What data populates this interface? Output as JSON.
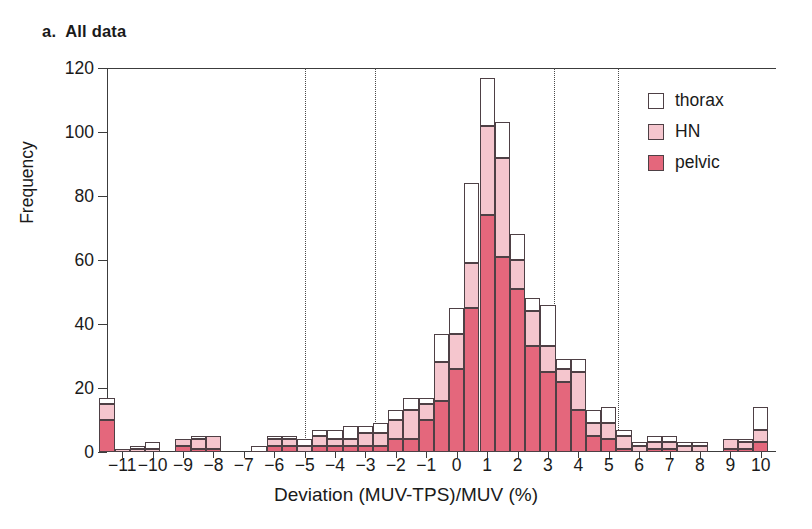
{
  "panel": {
    "label": "a.",
    "title": "All data"
  },
  "legend": {
    "position": "top-right",
    "entries": [
      {
        "name": "thorax",
        "color": "#ffffff"
      },
      {
        "name": "HN",
        "color": "#f5c6ce"
      },
      {
        "name": "pelvic",
        "color": "#e4677c"
      }
    ]
  },
  "chart_data": {
    "type": "bar",
    "subtype": "stacked-histogram",
    "title": "All data",
    "xlabel": "Deviation (MUV-TPS)/MUV (%)",
    "ylabel": "Frequency",
    "xlim": [
      -11.5,
      10.5
    ],
    "ylim": [
      0,
      120
    ],
    "yticks": [
      0,
      20,
      40,
      60,
      80,
      100,
      120
    ],
    "xticks": [
      -11,
      -10,
      -9,
      -8,
      -7,
      -6,
      -5,
      -4,
      -3,
      -2,
      -1,
      0,
      1,
      2,
      3,
      4,
      5,
      6,
      7,
      8,
      9,
      10
    ],
    "grid": "vertical-dotted",
    "gridlines_x": [
      -5.0,
      -2.7,
      3.2,
      5.3
    ],
    "bin_width": 0.5,
    "categories": [
      "-11.5",
      "-11.0",
      "-10.5",
      "-10.0",
      "-9.5",
      "-9.0",
      "-8.5",
      "-8.0",
      "-7.5",
      "-7.0",
      "-6.5",
      "-6.0",
      "-5.5",
      "-5.0",
      "-4.5",
      "-4.0",
      "-3.5",
      "-3.0",
      "-2.5",
      "-2.0",
      "-1.5",
      "-1.0",
      "-0.5",
      "0.0",
      "0.5",
      "1.0",
      "1.5",
      "2.0",
      "2.5",
      "3.0",
      "3.5",
      "4.0",
      "4.5",
      "5.0",
      "5.5",
      "6.0",
      "6.5",
      "7.0",
      "7.5",
      "8.0",
      "8.5",
      "9.0",
      "9.5",
      "10.0"
    ],
    "series": [
      {
        "name": "pelvic",
        "color": "#e4677c",
        "values": [
          10,
          0,
          0,
          0,
          0,
          2,
          1,
          1,
          0,
          0,
          0,
          2,
          2,
          0,
          2,
          2,
          2,
          2,
          2,
          4,
          4,
          10,
          16,
          26,
          45,
          74,
          61,
          51,
          33,
          25,
          22,
          13,
          5,
          4,
          1,
          0,
          1,
          1,
          0,
          0,
          0,
          1,
          1,
          3
        ]
      },
      {
        "name": "HN",
        "color": "#f5c6ce",
        "values": [
          5,
          1,
          1,
          1,
          0,
          2,
          3,
          4,
          0,
          0,
          0,
          2,
          2,
          2,
          3,
          2,
          2,
          4,
          4,
          6,
          9,
          5,
          12,
          11,
          14,
          28,
          31,
          9,
          11,
          8,
          4,
          12,
          4,
          5,
          4,
          2,
          2,
          2,
          2,
          2,
          0,
          3,
          2,
          4
        ]
      },
      {
        "name": "thorax",
        "color": "#ffffff",
        "values": [
          2,
          0,
          1,
          2,
          0,
          0,
          1,
          0,
          0,
          0,
          2,
          1,
          1,
          2,
          2,
          3,
          4,
          2,
          3,
          3,
          4,
          2,
          9,
          8,
          25,
          15,
          11,
          8,
          4,
          13,
          3,
          4,
          4,
          5,
          2,
          1,
          2,
          2,
          1,
          1,
          0,
          0,
          1,
          7
        ]
      }
    ],
    "totals": [
      17,
      1,
      2,
      3,
      0,
      4,
      5,
      5,
      0,
      0,
      2,
      5,
      5,
      4,
      7,
      7,
      8,
      8,
      9,
      13,
      17,
      17,
      37,
      45,
      84,
      117,
      103,
      68,
      48,
      46,
      29,
      29,
      13,
      14,
      7,
      3,
      5,
      5,
      3,
      3,
      0,
      4,
      4,
      14
    ]
  }
}
